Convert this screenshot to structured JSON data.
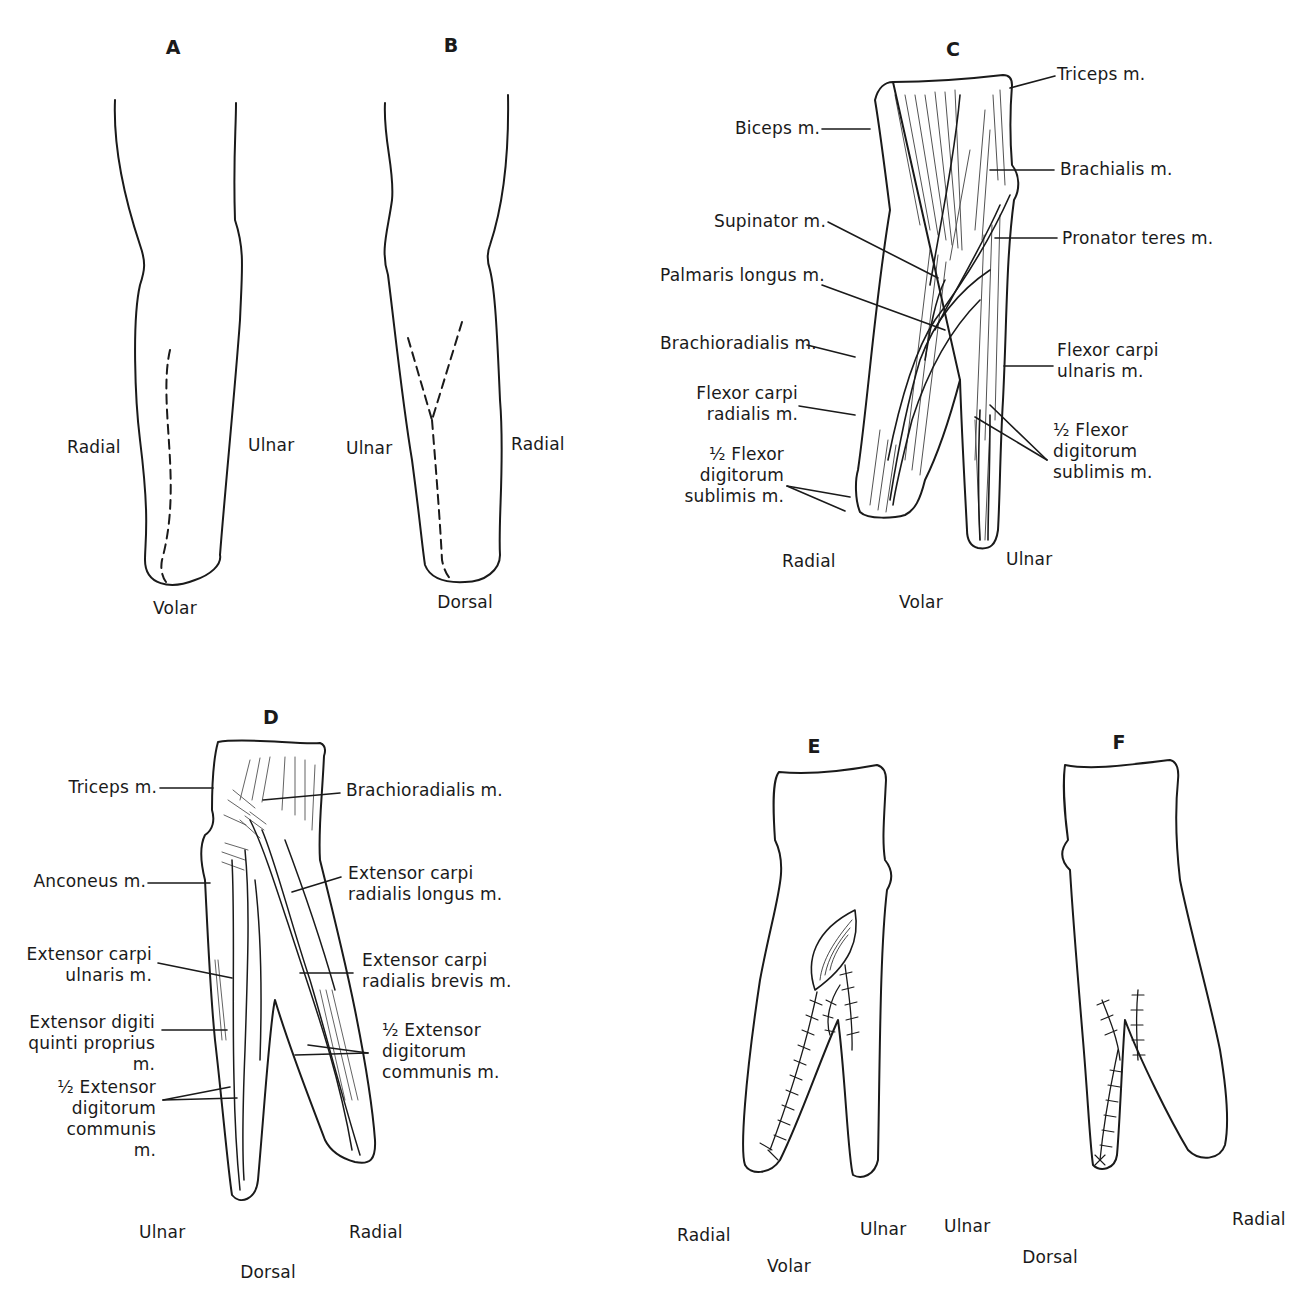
{
  "figure": {
    "panels": [
      {
        "id": "A",
        "letter": "A",
        "view": "Volar",
        "sides": {
          "left": "Radial",
          "right": "Ulnar"
        },
        "incision": "single curved dashed line"
      },
      {
        "id": "B",
        "letter": "B",
        "view": "Dorsal",
        "sides": {
          "left": "Ulnar",
          "right": "Radial"
        },
        "incision": "Y-shaped dashed line"
      },
      {
        "id": "C",
        "letter": "C",
        "view": "Volar",
        "sides": {
          "left": "Radial",
          "right": "Ulnar"
        },
        "labels": {
          "triceps": "Triceps m.",
          "biceps": "Biceps m.",
          "brachialis": "Brachialis m.",
          "supinator": "Supinator m.",
          "pronator_teres": "Pronator teres m.",
          "palmaris_longus": "Palmaris longus m.",
          "brachioradialis": "Brachioradialis m.",
          "fcu": "Flexor carpi\nulnaris m.",
          "fcr": "Flexor carpi\nradialis m.",
          "fds_left": "½ Flexor\ndigitorum\nsublimis m.",
          "fds_right": "½ Flexor\ndigitorum\nsublimis m."
        }
      },
      {
        "id": "D",
        "letter": "D",
        "view": "Dorsal",
        "sides": {
          "left": "Ulnar",
          "right": "Radial"
        },
        "labels": {
          "triceps": "Triceps m.",
          "brachioradialis": "Brachioradialis m.",
          "anconeus": "Anconeus m.",
          "ecrl": "Extensor carpi\nradialis longus m.",
          "ecu": "Extensor carpi\nulnaris m.",
          "ecrb": "Extensor carpi\nradialis brevis m.",
          "edqp": "Extensor digiti\nquinti proprius m.",
          "edc_right": "½ Extensor\ndigitorum\ncommunis m.",
          "edc_left": "½ Extensor\ndigitorum\ncommunis m."
        }
      },
      {
        "id": "E",
        "letter": "E",
        "view": "Volar",
        "sides": {
          "left": "Radial",
          "right": "Ulnar"
        },
        "detail": "sutured volar flaps with skin graft"
      },
      {
        "id": "F",
        "letter": "F",
        "view": "Dorsal",
        "sides": {
          "left": "Ulnar",
          "right": "Radial"
        },
        "detail": "sutured dorsal flaps"
      }
    ]
  },
  "colors": {
    "ink": "#1a1a1a",
    "background": "#ffffff"
  }
}
